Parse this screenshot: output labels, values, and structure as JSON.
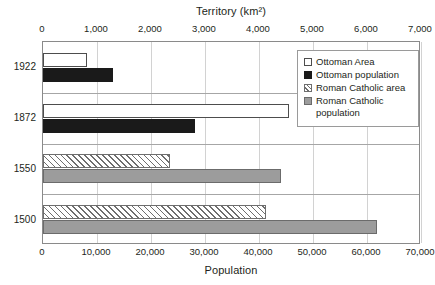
{
  "chart_data": {
    "type": "bar",
    "orientation": "horizontal",
    "title": "",
    "categories": [
      "1922",
      "1872",
      "1550",
      "1500"
    ],
    "series": [
      {
        "name": "Ottoman Area",
        "axis": "top",
        "unit": "km2",
        "values": [
          820,
          4550,
          null,
          null
        ],
        "swatch": "white-outline"
      },
      {
        "name": "Ottoman population",
        "axis": "bottom",
        "unit": "population",
        "values": [
          13000,
          28200,
          null,
          null
        ],
        "swatch": "solid-black"
      },
      {
        "name": "Roman Catholic area",
        "axis": "top",
        "unit": "km2",
        "values": [
          null,
          null,
          2350,
          4130
        ],
        "swatch": "diagonal-hatch"
      },
      {
        "name": "Roman Catholic population",
        "axis": "bottom",
        "unit": "population",
        "values": [
          null,
          null,
          44100,
          61900
        ],
        "swatch": "solid-gray"
      }
    ],
    "top_axis": {
      "label": "Territory (km²)",
      "ticks": [
        "0",
        "1,000",
        "2,000",
        "3,000",
        "4,000",
        "5,000",
        "6,000",
        "7,000"
      ],
      "tick_values": [
        0,
        1000,
        2000,
        3000,
        4000,
        5000,
        6000,
        7000
      ],
      "min": 0,
      "max": 7000
    },
    "bottom_axis": {
      "label": "Population",
      "ticks": [
        "0",
        "10,000",
        "20,000",
        "30,000",
        "40,000",
        "50,000",
        "60,000",
        "70,000"
      ],
      "tick_values": [
        0,
        10000,
        20000,
        30000,
        40000,
        50000,
        60000,
        70000
      ],
      "min": 0,
      "max": 70000
    },
    "legend": {
      "position": "top-right-inside",
      "entries": [
        "Ottoman Area",
        "Ottoman population",
        "Roman Catholic area",
        "Roman Catholic population"
      ]
    },
    "grid": {
      "vertical": true,
      "horizontal": false,
      "category_separators": true
    },
    "colors": {
      "background": "#ffffff",
      "axis_text": "#231f20",
      "gridline": "#d2d2d2",
      "plot_border": "#8a8a8a",
      "ottoman_area_fill": "#ffffff",
      "ottoman_area_stroke": "#4d4d4d",
      "ottoman_population_fill": "#1a1a1a",
      "roman_catholic_area_fill": "#ffffff",
      "roman_catholic_area_hatch": "#6e6e6e",
      "roman_catholic_population_fill": "#9c9c9c"
    }
  },
  "layout": {
    "plot_left_px": 42,
    "plot_top_px": 41,
    "plot_width_px": 378,
    "plot_height_px": 203,
    "category_band_height_px": 50.75,
    "bar_thickness_px": 14,
    "bar_gap_px": 1
  }
}
